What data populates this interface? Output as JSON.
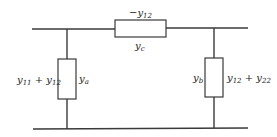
{
  "diagram": {
    "colors": {
      "line": "#3a3a3a",
      "text": "#222222",
      "background": "#ffffff"
    },
    "series_element": {
      "name": "y_c",
      "label_symbol": "y",
      "label_sub": "c",
      "value_prefix": "−y",
      "value_sub": "12"
    },
    "left_shunt": {
      "name": "y_a",
      "label_symbol": "y",
      "label_sub": "a",
      "value_part1": "y",
      "value_part1_sub": "11",
      "value_op": " + ",
      "value_part2": "y",
      "value_part2_sub": "12"
    },
    "right_shunt": {
      "name": "y_b",
      "label_symbol": "y",
      "label_sub": "b",
      "value_part1": "y",
      "value_part1_sub": "12",
      "value_op": " + ",
      "value_part2": "y",
      "value_part2_sub": "22"
    }
  }
}
